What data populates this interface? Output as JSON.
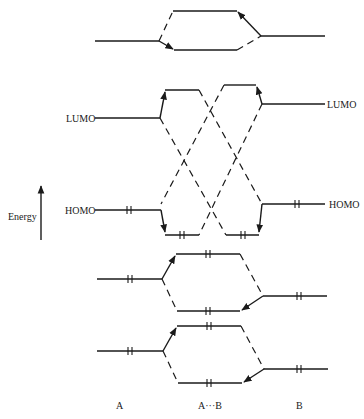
{
  "diagram": {
    "type": "molecular-orbital-interaction-diagram",
    "axis": {
      "label": "Energy",
      "direction": "up"
    },
    "level_labels": {
      "a_lumo": "LUMO",
      "a_homo": "HOMO",
      "b_lumo": "LUMO",
      "b_homo": "HOMO"
    },
    "column_labels": {
      "left": "A",
      "middle": "A···B",
      "right": "B"
    },
    "groups": [
      {
        "name": "top-interaction",
        "left_occupied": false,
        "right_occupied": false,
        "complex_upper_occupied": false,
        "complex_lower_occupied": false
      },
      {
        "name": "frontier-orbital-crossing",
        "a_homo_electrons": 2,
        "b_homo_electrons": 2,
        "complex_lower_left_electrons": 2,
        "complex_lower_right_electrons": 2
      },
      {
        "name": "filled-interaction-1",
        "left_electrons": 2,
        "right_electrons": 2,
        "complex_upper_electrons": 2,
        "complex_lower_electrons": 2
      },
      {
        "name": "filled-interaction-2",
        "left_electrons": 2,
        "right_electrons": 2,
        "complex_upper_electrons": 2,
        "complex_lower_electrons": 2
      }
    ],
    "colors": {
      "line": "#1a1a1a",
      "background": "#ffffff"
    }
  }
}
